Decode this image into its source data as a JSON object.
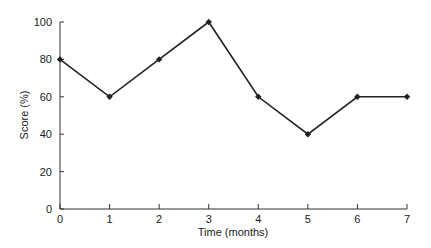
{
  "chart_data": {
    "type": "line",
    "title": "",
    "xlabel": "Time (months)",
    "ylabel": "Score (%)",
    "x": [
      0,
      1,
      2,
      3,
      4,
      5,
      6,
      7
    ],
    "series": [
      {
        "name": "Score",
        "values": [
          80,
          60,
          80,
          100,
          60,
          40,
          60,
          60
        ],
        "marker": "diamond",
        "color": "#222222"
      }
    ],
    "xlim": [
      0,
      7
    ],
    "ylim": [
      0,
      100
    ],
    "xticks": [
      0,
      1,
      2,
      3,
      4,
      5,
      6,
      7
    ],
    "yticks": [
      0,
      20,
      40,
      60,
      80,
      100
    ],
    "grid": false,
    "legend": null
  }
}
